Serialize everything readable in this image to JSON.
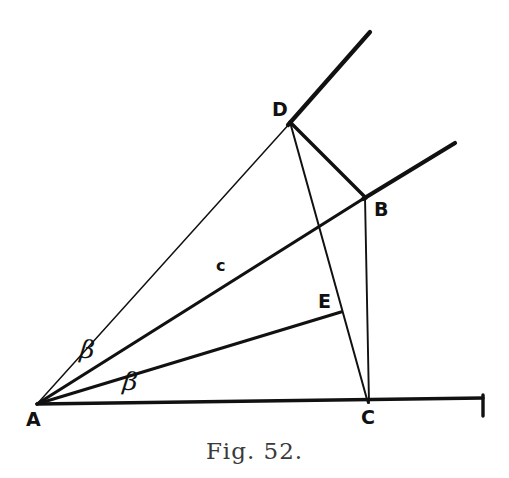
{
  "figure": {
    "caption": "Fig. 52.",
    "background_color": "#ffffff",
    "ink_color": "#111111",
    "caption_color": "#3a3a3a",
    "width": 509,
    "height": 478,
    "vertices": [
      {
        "id": "A",
        "label": "A",
        "x": 37,
        "y": 404,
        "label_x": 26,
        "label_y": 410
      },
      {
        "id": "B",
        "label": "B",
        "x": 365,
        "y": 197,
        "label_x": 374,
        "label_y": 200
      },
      {
        "id": "C",
        "label": "C",
        "x": 368,
        "y": 402,
        "label_x": 361,
        "label_y": 408
      },
      {
        "id": "D",
        "label": "D",
        "x": 290,
        "y": 122,
        "label_x": 272,
        "label_y": 100
      },
      {
        "id": "E",
        "label": "E",
        "x": 340,
        "y": 312,
        "label_x": 318,
        "label_y": 292
      }
    ],
    "segments": [
      {
        "id": "baseline-A-to-right",
        "from": "A",
        "to": "right-end",
        "x1": 37,
        "y1": 404,
        "x2": 483,
        "y2": 398,
        "weight": "thick"
      },
      {
        "id": "baseline-end-tick",
        "from": "right-end",
        "to": "tick",
        "x1": 483,
        "y1": 396,
        "x2": 483,
        "y2": 416,
        "weight": "thick"
      },
      {
        "id": "ray-A-through-D",
        "from": "A",
        "to": "ray-end-upper",
        "x1": 37,
        "y1": 404,
        "x2": 370,
        "y2": 32,
        "weight": "thin-to-thick"
      },
      {
        "id": "ray-A-through-B",
        "from": "A",
        "to": "ray-end-lower",
        "x1": 37,
        "y1": 404,
        "x2": 455,
        "y2": 143,
        "weight": "thick"
      },
      {
        "id": "segment-A-to-E",
        "from": "A",
        "to": "E",
        "x1": 37,
        "y1": 404,
        "x2": 340,
        "y2": 312,
        "weight": "thick"
      },
      {
        "id": "segment-D-to-B",
        "from": "D",
        "to": "B",
        "x1": 290,
        "y1": 122,
        "x2": 365,
        "y2": 197,
        "weight": "thick"
      },
      {
        "id": "segment-D-to-C",
        "from": "D",
        "to": "C",
        "x1": 290,
        "y1": 122,
        "x2": 368,
        "y2": 402,
        "weight": "thin"
      },
      {
        "id": "segment-B-to-C",
        "from": "B",
        "to": "C",
        "x1": 365,
        "y1": 197,
        "x2": 368,
        "y2": 402,
        "weight": "thin"
      }
    ],
    "annotations": [
      {
        "id": "angle-beta-DAB",
        "text": "β",
        "x": 80,
        "y": 337,
        "kind": "angle"
      },
      {
        "id": "angle-beta-EAC",
        "text": "β",
        "x": 123,
        "y": 369,
        "kind": "angle"
      },
      {
        "id": "side-label-c",
        "text": "c",
        "x": 216,
        "y": 256,
        "kind": "side"
      }
    ]
  }
}
